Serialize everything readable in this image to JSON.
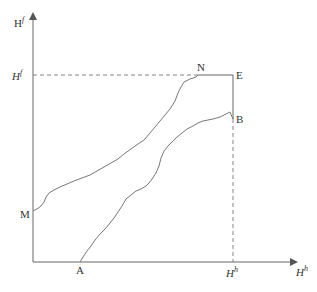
{
  "diagram": {
    "y_axis_label": "H",
    "y_axis_label_sup": "f",
    "x_axis_label": "H",
    "x_axis_label_sup": "h",
    "y_tick_label": "H",
    "y_tick_label_sup": "f",
    "x_tick_label": "H",
    "x_tick_label_sup": "h",
    "points": {
      "M": "M",
      "N": "N",
      "E": "E",
      "B": "B",
      "A": "A"
    },
    "colors": {
      "line": "#777777",
      "text": "#333333",
      "background": "#ffffff"
    }
  }
}
